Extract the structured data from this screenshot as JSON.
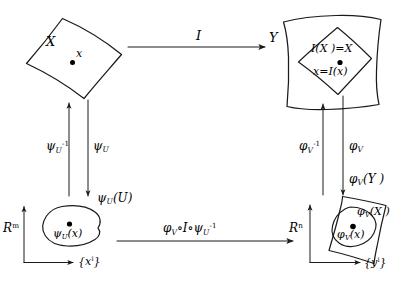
{
  "figure": {
    "kind": "commutative-diagram",
    "background_color": "#ffffff",
    "stroke_color": "#1a1a1a"
  },
  "nodes": {
    "top_left": {
      "name": "manifold-X",
      "label": "X",
      "point_label": "x"
    },
    "top_right": {
      "name": "manifold-Y",
      "label": "Y",
      "inner_label": "I(X )=X",
      "point_label": "x=I(x)"
    },
    "bottom_left": {
      "name": "coordinate-space-Rm",
      "space_label": "R",
      "space_exponent": "m",
      "region_label": "ψ",
      "region_label_sub": "U",
      "region_label_arg": "(U)",
      "point_label": "ψ",
      "point_label_sub": "U",
      "point_label_arg": "(x)",
      "axis_label": "{x",
      "axis_label_sup": "i",
      "axis_label_end": "}"
    },
    "bottom_right": {
      "name": "coordinate-space-Rn",
      "space_label": "R",
      "space_exponent": "n",
      "outer_label": "φ",
      "outer_label_sub": "V",
      "outer_label_arg": "(Y )",
      "inner_label": "φ",
      "inner_label_sub": "V",
      "inner_label_arg": "(X )",
      "point_label": "φ",
      "point_label_sub": "V",
      "point_label_arg": "(x)",
      "axis_label": "{y",
      "axis_label_sup": "i",
      "axis_label_end": "}"
    }
  },
  "arrows": {
    "top": {
      "name": "arrow-I",
      "label": "I",
      "direction": "right"
    },
    "bottom": {
      "name": "arrow-phiV-I-psiU-inverse",
      "label": "φ",
      "label_sub": "V",
      "label_mid": "∘I∘ψ",
      "label_sub2": "U",
      "label_sup2": "-1",
      "direction": "right"
    },
    "left_up": {
      "name": "arrow-psiU-inverse",
      "label": "ψ",
      "label_sub": "U",
      "label_sup": "-1",
      "direction": "up"
    },
    "left_down": {
      "name": "arrow-psiU",
      "label": "ψ",
      "label_sub": "U",
      "direction": "down"
    },
    "right_up": {
      "name": "arrow-phiV-inverse",
      "label": "φ",
      "label_sub": "V",
      "label_sup": "-1",
      "direction": "up"
    },
    "right_down": {
      "name": "arrow-phiV",
      "label": "φ",
      "label_sub": "V",
      "direction": "down"
    }
  }
}
